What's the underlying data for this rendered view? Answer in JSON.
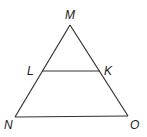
{
  "diagram": {
    "type": "triangle",
    "stroke_color": "#333333",
    "points": {
      "M": {
        "label": "M",
        "x": 70,
        "y": 25
      },
      "L": {
        "label": "L",
        "x": 42,
        "y": 71
      },
      "K": {
        "label": "K",
        "x": 100,
        "y": 71
      },
      "N": {
        "label": "N",
        "x": 15,
        "y": 117
      },
      "O": {
        "label": "O",
        "x": 128,
        "y": 116
      }
    },
    "segments": [
      [
        "M",
        "N"
      ],
      [
        "M",
        "O"
      ],
      [
        "N",
        "O"
      ],
      [
        "L",
        "K"
      ]
    ],
    "label_positions": {
      "M": {
        "x": 65,
        "y": 19
      },
      "L": {
        "x": 27,
        "y": 75
      },
      "K": {
        "x": 104,
        "y": 75
      },
      "N": {
        "x": 4,
        "y": 129
      },
      "O": {
        "x": 130,
        "y": 129
      }
    }
  }
}
